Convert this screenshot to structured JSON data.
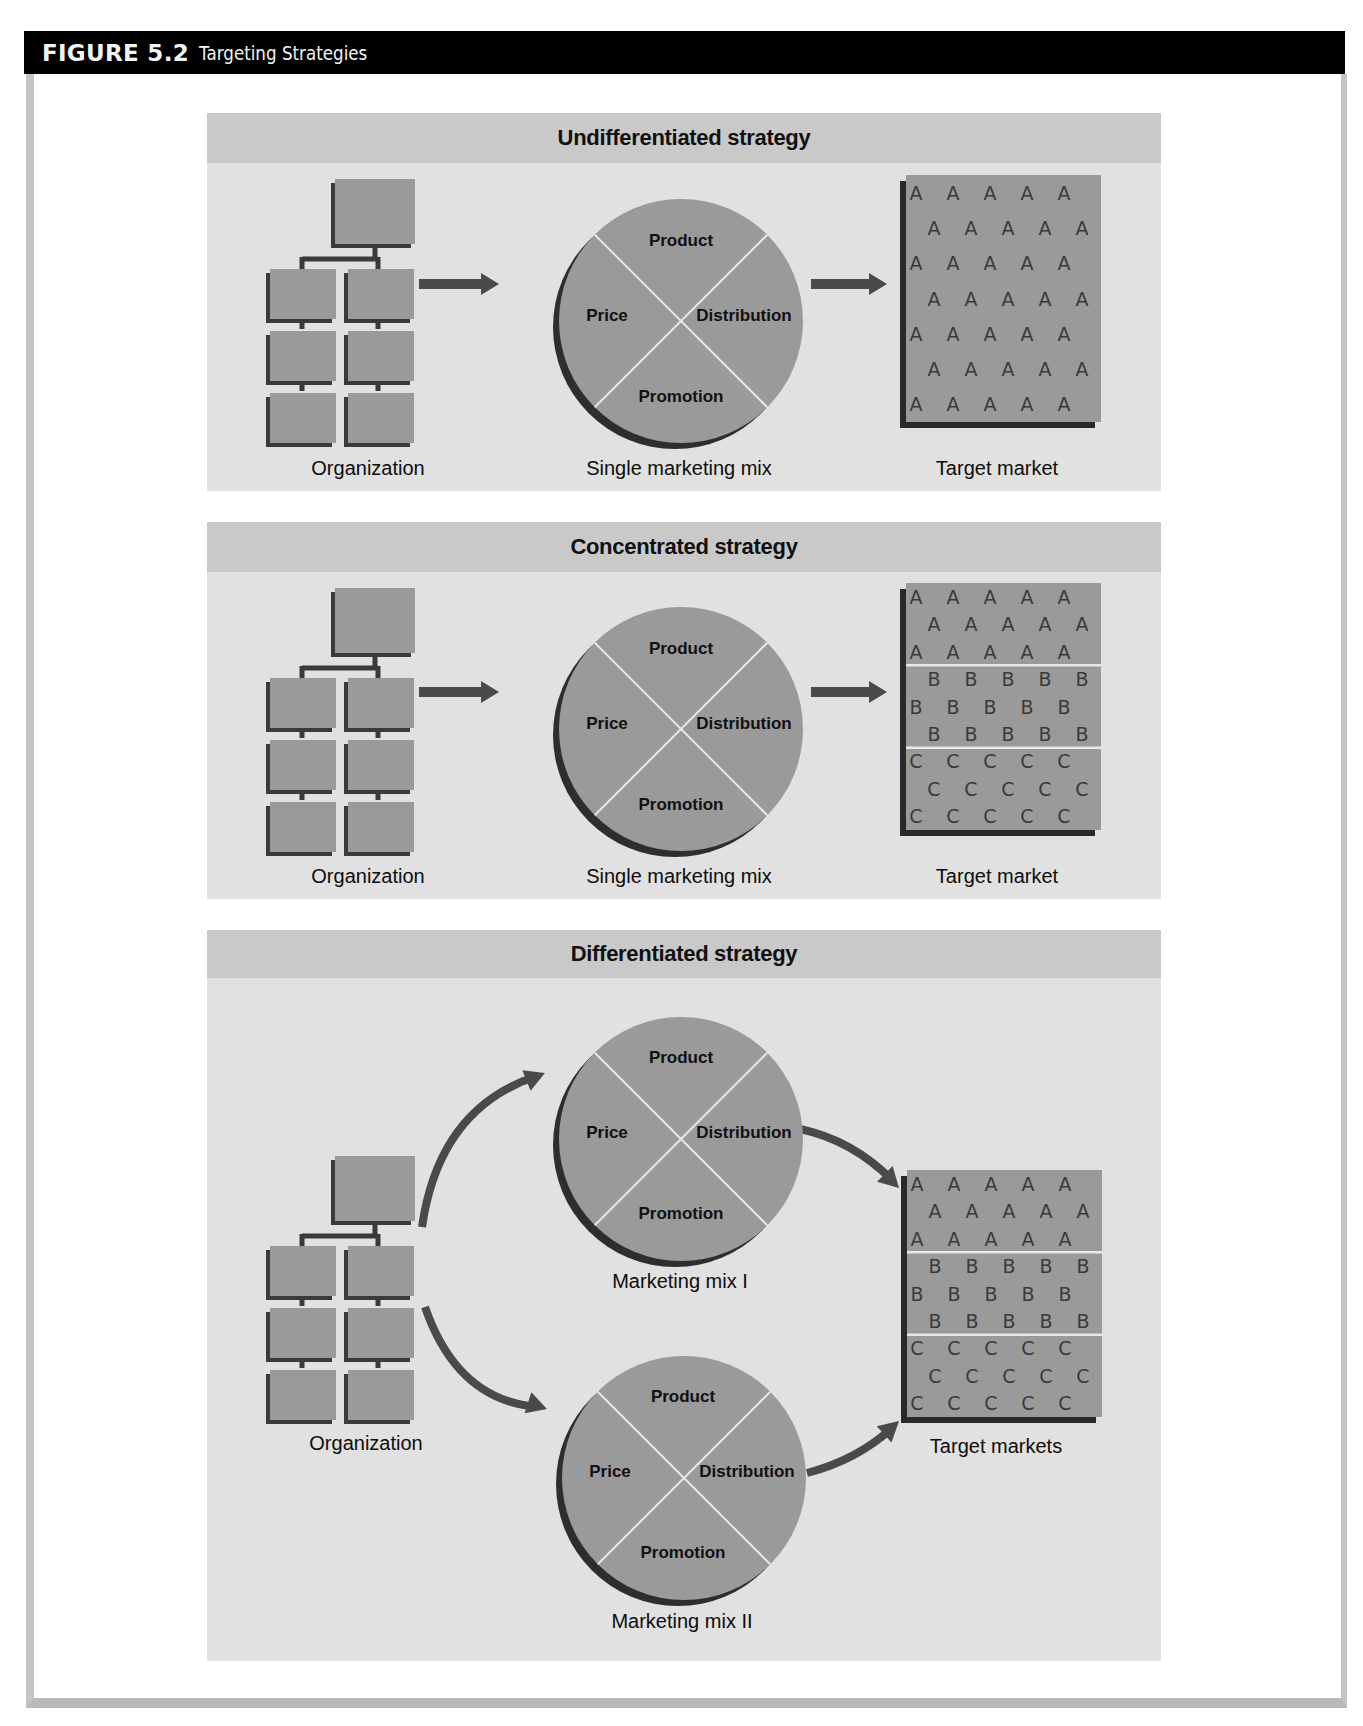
{
  "figure": {
    "number": "FIGURE 5.2",
    "title": "Targeting Strategies"
  },
  "colors": {
    "header_bg": "#000000",
    "panel_bg": "#e1e1e1",
    "panel_header_bg": "#c9c9c9",
    "shape_fill": "#9a9a9a",
    "shape_shadow": "#3a3a3a",
    "divider": "#e6e6e6"
  },
  "panels": [
    {
      "title": "Undifferentiated strategy",
      "organization_label": "Organization",
      "mixes": [
        {
          "label": "Single marketing mix",
          "quadrants": {
            "top": "Product",
            "left": "Price",
            "right": "Distribution",
            "bottom": "Promotion"
          }
        }
      ],
      "target_label": "Target market",
      "target_segments": [
        {
          "letter": "A",
          "rows": 7
        }
      ]
    },
    {
      "title": "Concentrated strategy",
      "organization_label": "Organization",
      "mixes": [
        {
          "label": "Single marketing mix",
          "quadrants": {
            "top": "Product",
            "left": "Price",
            "right": "Distribution",
            "bottom": "Promotion"
          }
        }
      ],
      "target_label": "Target market",
      "target_segments": [
        {
          "letter": "A",
          "rows": 3
        },
        {
          "letter": "B",
          "rows": 3
        },
        {
          "letter": "C",
          "rows": 3
        }
      ]
    },
    {
      "title": "Differentiated strategy",
      "organization_label": "Organization",
      "mixes": [
        {
          "label": "Marketing mix I",
          "quadrants": {
            "top": "Product",
            "left": "Price",
            "right": "Distribution",
            "bottom": "Promotion"
          }
        },
        {
          "label": "Marketing mix II",
          "quadrants": {
            "top": "Product",
            "left": "Price",
            "right": "Distribution",
            "bottom": "Promotion"
          }
        }
      ],
      "target_label": "Target markets",
      "target_segments": [
        {
          "letter": "A",
          "rows": 3
        },
        {
          "letter": "B",
          "rows": 3
        },
        {
          "letter": "C",
          "rows": 3
        }
      ]
    }
  ]
}
